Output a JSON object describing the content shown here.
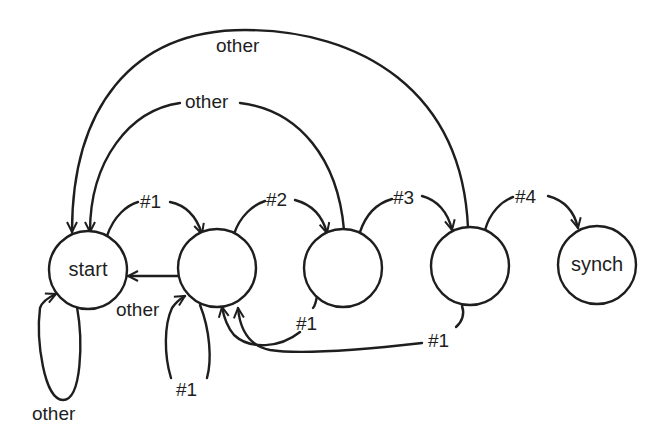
{
  "diagram": {
    "type": "state-machine",
    "colors": {
      "stroke": "#1e1e1e",
      "background": "#ffffff"
    },
    "states": [
      {
        "id": "start",
        "label": "start"
      },
      {
        "id": "s1",
        "label": ""
      },
      {
        "id": "s2",
        "label": ""
      },
      {
        "id": "s3",
        "label": ""
      },
      {
        "id": "synch",
        "label": "synch"
      }
    ],
    "transitions": [
      {
        "from": "start",
        "to": "s1",
        "label": "#1"
      },
      {
        "from": "s1",
        "to": "s2",
        "label": "#2"
      },
      {
        "from": "s2",
        "to": "s3",
        "label": "#3"
      },
      {
        "from": "s3",
        "to": "synch",
        "label": "#4"
      },
      {
        "from": "start",
        "to": "start",
        "label": "other"
      },
      {
        "from": "s1",
        "to": "start",
        "label": "other"
      },
      {
        "from": "s1",
        "to": "s1",
        "label": "#1"
      },
      {
        "from": "s2",
        "to": "s1",
        "label": "#1"
      },
      {
        "from": "s3",
        "to": "s1",
        "label": "#1"
      },
      {
        "from": "s2",
        "to": "start",
        "label": "other"
      },
      {
        "from": "s3",
        "to": "start",
        "label": "other"
      }
    ]
  }
}
